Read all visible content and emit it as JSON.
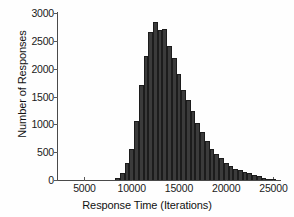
{
  "chart_data": {
    "type": "bar",
    "title": "",
    "xlabel": "Response Time (Iterations)",
    "ylabel": "Number of Responses",
    "xlim": [
      2200,
      25800
    ],
    "ylim": [
      0,
      3000
    ],
    "xticks": [
      5000,
      10000,
      15000,
      20000,
      25000
    ],
    "yticks": [
      0,
      500,
      1000,
      1500,
      2000,
      2500,
      3000
    ],
    "xtick_labels": [
      "5000",
      "10000",
      "15000",
      "20000",
      "25000"
    ],
    "ytick_labels": [
      "0",
      "500",
      "1000",
      "1500",
      "2000",
      "2500",
      "3000"
    ],
    "grid": false,
    "legend": false,
    "bar_color": "#3b3b3b",
    "bar_edge_color": "#1c1c1c",
    "bin_width": 500,
    "bin_starts": [
      8250,
      8750,
      9250,
      9750,
      10250,
      10750,
      11250,
      11750,
      12250,
      12750,
      13250,
      13750,
      14250,
      14750,
      15250,
      15750,
      16250,
      16750,
      17250,
      17750,
      18250,
      18750,
      19250,
      19750,
      20250,
      20750,
      21250,
      21750,
      22250,
      22750,
      23250,
      23750,
      24250,
      24750
    ],
    "categories": [
      "8250",
      "8750",
      "9250",
      "9750",
      "10250",
      "10750",
      "11250",
      "11750",
      "12250",
      "12750",
      "13250",
      "13750",
      "14250",
      "14750",
      "15250",
      "15750",
      "16250",
      "16750",
      "17250",
      "17750",
      "18250",
      "18750",
      "19250",
      "19750",
      "20250",
      "20750",
      "21250",
      "21750",
      "22250",
      "22750",
      "23250",
      "23750",
      "24250",
      "24750"
    ],
    "values": [
      40,
      120,
      300,
      560,
      1060,
      1700,
      2230,
      2660,
      2830,
      2700,
      2710,
      2400,
      2200,
      1900,
      1620,
      1440,
      1240,
      1020,
      870,
      700,
      560,
      470,
      400,
      300,
      250,
      200,
      175,
      150,
      120,
      95,
      70,
      45,
      25,
      12
    ]
  }
}
